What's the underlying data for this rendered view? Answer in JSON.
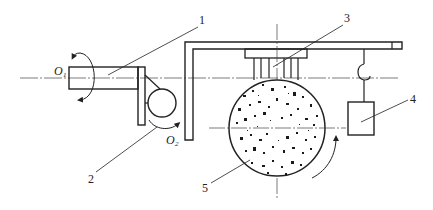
{
  "diagram": {
    "type": "mechanical schematic",
    "colors": {
      "stroke": "#222222",
      "background": "#ffffff",
      "particle": "#1a1a1a"
    },
    "labels": {
      "part1": "1",
      "part2": "2",
      "part3": "3",
      "part4": "4",
      "part5": "5",
      "axis1_main": "O",
      "axis1_sub": "1",
      "axis2_main": "O",
      "axis2_sub": "2"
    },
    "components": [
      {
        "id": "1",
        "description": "rotating shaft about axis O1"
      },
      {
        "id": "2",
        "description": "small wheel rotating about axis O2"
      },
      {
        "id": "3",
        "description": "clamp / holder with fingers"
      },
      {
        "id": "4",
        "description": "hanging weight"
      },
      {
        "id": "5",
        "description": "large grinding disc with abrasive particles"
      }
    ]
  }
}
